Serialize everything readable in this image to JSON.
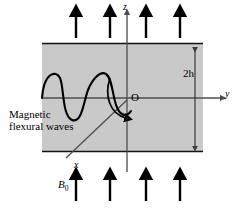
{
  "figure": {
    "title_caption": "",
    "colors": {
      "slab_fill": "#c9c9c9",
      "slab_border": "#1a1a1a",
      "axis": "#4d4d4d",
      "wave": "#000000",
      "arrow": "#000000",
      "dimension": "#4d4d4d",
      "background": "#ffffff"
    },
    "labels": {
      "axis_z": "z",
      "axis_y": "y",
      "axis_x": "x",
      "origin": "O",
      "thickness": "2h",
      "field": "B",
      "field_sub": "0",
      "wave_line1": "Magnetic",
      "wave_line2": "flexural waves"
    },
    "arrows": {
      "top_count": 4,
      "bottom_count": 4,
      "direction": "up",
      "top_x_positions": [
        76,
        110,
        146,
        180
      ],
      "bottom_x_positions": [
        76,
        110,
        146,
        180
      ]
    },
    "slab": {
      "left": 42,
      "top": 43,
      "right": 203,
      "bottom": 152
    },
    "wave": {
      "cycles": 2,
      "baseline_y": 98,
      "amplitude": 22,
      "start_x": 42,
      "end_x": 132
    }
  }
}
